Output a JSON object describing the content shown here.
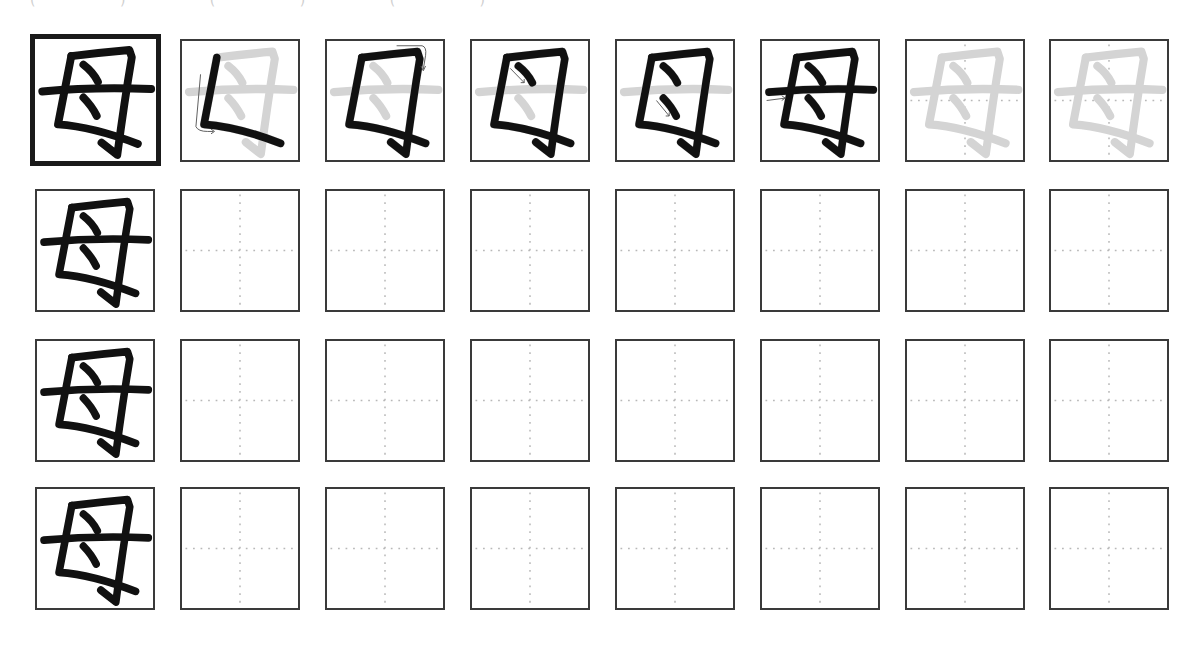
{
  "worksheet": {
    "header_fragment": "( )   ( )  (    )",
    "character": "母",
    "stroke_count": 5,
    "colors": {
      "ink": "#111111",
      "ghost": "#d4d4d4",
      "guide": "#b8b8b8",
      "border": "#3a3a3a",
      "arrow": "#555555"
    },
    "stroke_order_row": [
      {
        "step": 0,
        "label": "complete",
        "type": "model"
      },
      {
        "step": 1,
        "label": "stroke 1 (vertical-turn)",
        "type": "step"
      },
      {
        "step": 2,
        "label": "stroke 2 (horizontal-fold-hook)",
        "type": "step"
      },
      {
        "step": 3,
        "label": "stroke 3 (dot)",
        "type": "step"
      },
      {
        "step": 4,
        "label": "stroke 4 (dot)",
        "type": "step"
      },
      {
        "step": 5,
        "label": "stroke 5 (horizontal)",
        "type": "step"
      },
      {
        "step": 6,
        "label": "trace",
        "type": "trace"
      },
      {
        "step": 7,
        "label": "trace",
        "type": "trace"
      }
    ],
    "practice_rows": 3,
    "practice_cols": 7
  }
}
